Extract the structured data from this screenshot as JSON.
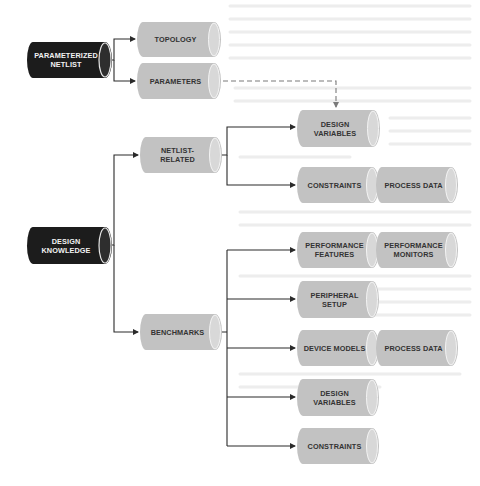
{
  "diagram": {
    "title": "",
    "colors": {
      "background": "#ffffff",
      "root_fill": "#1c1c1c",
      "node_fill": "#c2c2c2",
      "node_cap": "#d9d9d9",
      "line": "#2a2a2a",
      "dashed_line": "#7a7a7a"
    },
    "roots": [
      {
        "id": "parameterized-netlist",
        "label": "PARAMETERIZED\nNETLIST"
      },
      {
        "id": "design-knowledge",
        "label": "DESIGN\nKNOWLEDGE"
      }
    ],
    "nodes": {
      "topology": "TOPOLOGY",
      "parameters": "PARAMETERS",
      "netlist_related": "NETLIST-\nRELATED",
      "benchmarks": "BENCHMARKS",
      "design_variables_1": "DESIGN\nVARIABLES",
      "constraints_1": "CONSTRAINTS",
      "process_data_1": "PROCESS DATA",
      "performance_features": "PERFORMANCE\nFEATURES",
      "performance_monitors": "PERFORMANCE\nMONITORS",
      "peripheral_setup": "PERIPHERAL\nSETUP",
      "device_models": "DEVICE MODELS",
      "process_data_2": "PROCESS DATA",
      "design_variables_2": "DESIGN\nVARIABLES",
      "constraints_2": "CONSTRAINTS"
    },
    "edges": [
      {
        "from": "PARAMETERIZED NETLIST",
        "to": "TOPOLOGY",
        "style": "solid"
      },
      {
        "from": "PARAMETERIZED NETLIST",
        "to": "PARAMETERS",
        "style": "solid"
      },
      {
        "from": "PARAMETERS",
        "to": "DESIGN VARIABLES",
        "style": "dashed"
      },
      {
        "from": "DESIGN KNOWLEDGE",
        "to": "NETLIST-RELATED",
        "style": "solid"
      },
      {
        "from": "DESIGN KNOWLEDGE",
        "to": "BENCHMARKS",
        "style": "solid"
      },
      {
        "from": "NETLIST-RELATED",
        "to": "DESIGN VARIABLES",
        "style": "solid"
      },
      {
        "from": "NETLIST-RELATED",
        "to": "CONSTRAINTS + PROCESS DATA",
        "style": "solid"
      },
      {
        "from": "BENCHMARKS",
        "to": "PERFORMANCE FEATURES + PERFORMANCE MONITORS",
        "style": "solid"
      },
      {
        "from": "BENCHMARKS",
        "to": "PERIPHERAL SETUP",
        "style": "solid"
      },
      {
        "from": "BENCHMARKS",
        "to": "DEVICE MODELS + PROCESS DATA",
        "style": "solid"
      },
      {
        "from": "BENCHMARKS",
        "to": "DESIGN VARIABLES",
        "style": "solid"
      },
      {
        "from": "BENCHMARKS",
        "to": "CONSTRAINTS",
        "style": "solid"
      }
    ]
  }
}
